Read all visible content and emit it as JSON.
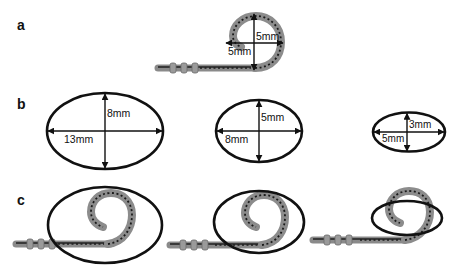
{
  "figure": {
    "panels": [
      {
        "label": "a",
        "description": "Pigtail catheter coil with measured dimensions",
        "dimensions": {
          "vertical": "5mm",
          "horizontal": "5mm"
        }
      },
      {
        "label": "b",
        "description": "Elliptical templates with labeled axes",
        "ellipses": [
          {
            "major_axis": "13mm",
            "minor_axis": "8mm"
          },
          {
            "major_axis": "8mm",
            "minor_axis": "5mm"
          },
          {
            "major_axis": "5mm",
            "minor_axis": "3mm"
          }
        ]
      },
      {
        "label": "c",
        "description": "Catheter coil overlaid on each elliptical template",
        "overlays": [
          {
            "ellipse": "13mm x 8mm"
          },
          {
            "ellipse": "8mm x 5mm"
          },
          {
            "ellipse": "5mm x 3mm"
          }
        ]
      }
    ],
    "colors": {
      "outline": "#111111",
      "catheter_body": "#8c8c8c",
      "catheter_markings": "#1a1a1a",
      "background": "#ffffff"
    }
  }
}
